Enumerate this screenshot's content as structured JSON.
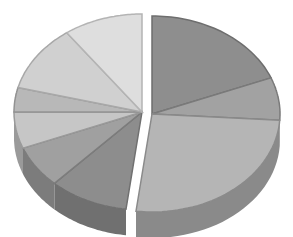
{
  "chart_data": {
    "type": "pie",
    "style": "3d-exploded",
    "title": "",
    "legend": "none",
    "slices": [
      {
        "label": "",
        "value": 19,
        "color": "#8e8e8e",
        "side": "#6e6e6e",
        "group": "right"
      },
      {
        "label": "",
        "value": 7,
        "color": "#a2a2a2",
        "side": "#7a7a7a",
        "group": "right"
      },
      {
        "label": "",
        "value": 26,
        "color": "#b5b5b5",
        "side": "#8a8a8a",
        "group": "right"
      },
      {
        "label": "",
        "value": 10,
        "color": "#8d8d8d",
        "side": "#707070",
        "group": "left"
      },
      {
        "label": "",
        "value": 7,
        "color": "#a0a0a0",
        "side": "#7c7c7c",
        "group": "left"
      },
      {
        "label": "",
        "value": 6,
        "color": "#c6c6c6",
        "side": "#9a9a9a",
        "group": "left"
      },
      {
        "label": "",
        "value": 4,
        "color": "#b8b8b8",
        "side": "#929292",
        "group": "left"
      },
      {
        "label": "",
        "value": 11,
        "color": "#d0d0d0",
        "side": "#a8a8a8",
        "group": "left"
      },
      {
        "label": "",
        "value": 10,
        "color": "#dedede",
        "side": "#b4b4b4",
        "group": "left"
      }
    ]
  }
}
